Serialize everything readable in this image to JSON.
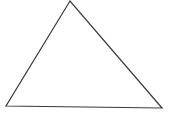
{
  "diagram": {
    "type": "triangle",
    "background": "#ffffff",
    "stroke_color": "#3a3a3a",
    "stroke_width": 1.2,
    "fill": "none",
    "vertices": {
      "apex": {
        "x": 70,
        "y": 1
      },
      "bottom_left": {
        "x": 6,
        "y": 106
      },
      "bottom_right": {
        "x": 162,
        "y": 108
      }
    },
    "points_attr": "70,1 6,106 162,108"
  }
}
